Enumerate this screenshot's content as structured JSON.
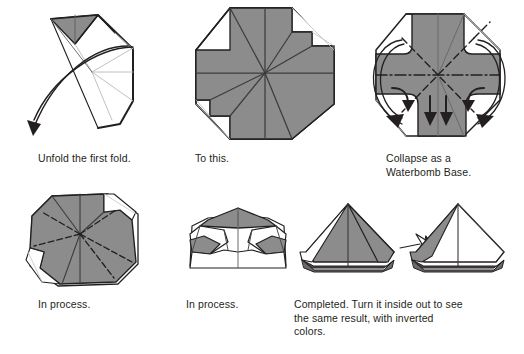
{
  "document": {
    "kind": "origami-instruction-diagram",
    "title": "Waterbomb Base Collapse Sequence",
    "background_color": "#ffffff",
    "paper_shaded_color": "#8c8c8c",
    "paper_white_color": "#ffffff",
    "line_color": "#231f20",
    "text_color": "#231f20"
  },
  "steps": [
    {
      "id": "unfold",
      "caption": "Unfold the first fold.",
      "figure_name": "origami-unfold-first-fold-figure",
      "has_motion_arrow": true,
      "arrow_count": 1
    },
    {
      "id": "to-this",
      "caption": "To this.",
      "figure_name": "origami-octagon-creased-figure",
      "has_motion_arrow": false,
      "arrow_count": 0
    },
    {
      "id": "collapse",
      "caption": "Collapse as a\nWaterbomb Base.",
      "figure_name": "origami-collapse-waterbomb-figure",
      "has_motion_arrow": true,
      "arrow_count": 4
    },
    {
      "id": "in-process-1",
      "caption": "In process.",
      "figure_name": "origami-in-process-one-figure",
      "has_motion_arrow": false,
      "arrow_count": 0
    },
    {
      "id": "in-process-2",
      "caption": "In process.",
      "figure_name": "origami-in-process-two-figure",
      "has_motion_arrow": false,
      "arrow_count": 0
    },
    {
      "id": "completed",
      "caption": "Completed. Turn it inside out to see\nthe same result, with inverted\ncolors.",
      "figure_name": "origami-completed-pair-figure",
      "has_motion_arrow": true,
      "arrow_count": 1
    }
  ]
}
